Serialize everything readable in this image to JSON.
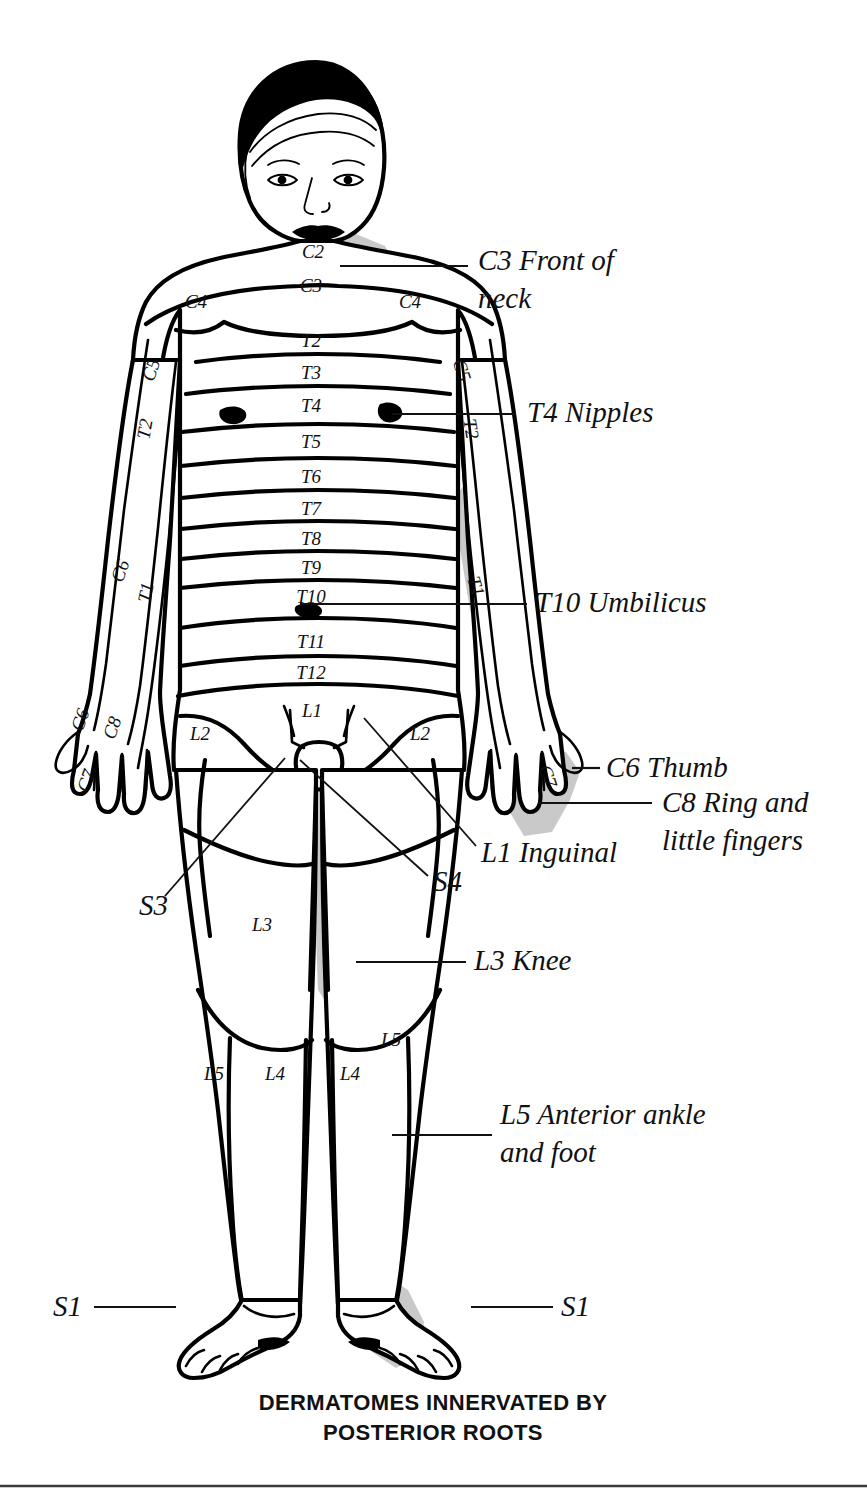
{
  "figure": {
    "caption_line1": "DERMATOMES INNERVATED BY",
    "caption_line2": "POSTERIOR ROOTS",
    "view": "anterior",
    "colors": {
      "ink": "#000000",
      "shade": "#c9c9c9",
      "background": "#ffffff"
    }
  },
  "segment_labels": [
    {
      "id": "c2-neck",
      "text": "C2",
      "x": 313,
      "y": 258,
      "rotate": 0
    },
    {
      "id": "c3-neck",
      "text": "C3",
      "x": 311,
      "y": 292,
      "rotate": 0
    },
    {
      "id": "c4-left-shoulder",
      "text": "C4",
      "x": 196,
      "y": 308,
      "rotate": 0
    },
    {
      "id": "c4-right-shoulder",
      "text": "C4",
      "x": 410,
      "y": 308,
      "rotate": 0
    },
    {
      "id": "c5-left-arm",
      "text": "C5",
      "x": 157,
      "y": 372,
      "rotate": -72
    },
    {
      "id": "c5-right-arm",
      "text": "C5",
      "x": 456,
      "y": 372,
      "rotate": 72
    },
    {
      "id": "t2-chest",
      "text": "T2",
      "x": 311,
      "y": 347,
      "rotate": 0
    },
    {
      "id": "t3-chest",
      "text": "T3",
      "x": 311,
      "y": 379,
      "rotate": 0
    },
    {
      "id": "t4-chest",
      "text": "T4",
      "x": 311,
      "y": 412,
      "rotate": 0
    },
    {
      "id": "t5-chest",
      "text": "T5",
      "x": 311,
      "y": 448,
      "rotate": 0
    },
    {
      "id": "t6-chest",
      "text": "T6",
      "x": 311,
      "y": 483,
      "rotate": 0
    },
    {
      "id": "t7-abdomen",
      "text": "T7",
      "x": 311,
      "y": 515,
      "rotate": 0
    },
    {
      "id": "t8-abdomen",
      "text": "T8",
      "x": 311,
      "y": 545,
      "rotate": 0
    },
    {
      "id": "t9-abdomen",
      "text": "T9",
      "x": 311,
      "y": 574,
      "rotate": 0
    },
    {
      "id": "t10-abdomen",
      "text": "T10",
      "x": 311,
      "y": 603,
      "rotate": 0
    },
    {
      "id": "t11-abdomen",
      "text": "T11",
      "x": 311,
      "y": 648,
      "rotate": 0
    },
    {
      "id": "t12-abdomen",
      "text": "T12",
      "x": 311,
      "y": 679,
      "rotate": 0
    },
    {
      "id": "t2-left-axilla",
      "text": "T2",
      "x": 151,
      "y": 430,
      "rotate": -80
    },
    {
      "id": "t2-right-axilla",
      "text": "T2",
      "x": 465,
      "y": 430,
      "rotate": 80
    },
    {
      "id": "c6-left-forearm",
      "text": "C6",
      "x": 126,
      "y": 573,
      "rotate": -70
    },
    {
      "id": "t1-left-forearm",
      "text": "T1",
      "x": 152,
      "y": 594,
      "rotate": -78
    },
    {
      "id": "t1-right-forearm",
      "text": "T1",
      "x": 470,
      "y": 588,
      "rotate": 73
    },
    {
      "id": "c6-left-hand",
      "text": "C6",
      "x": 86,
      "y": 722,
      "rotate": -70
    },
    {
      "id": "c8-left-hand",
      "text": "C8",
      "x": 118,
      "y": 730,
      "rotate": -70
    },
    {
      "id": "c7-left-hand",
      "text": "C7",
      "x": 92,
      "y": 783,
      "rotate": -70
    },
    {
      "id": "c7-right-hand",
      "text": "C7",
      "x": 542,
      "y": 778,
      "rotate": 72
    },
    {
      "id": "l1-groin",
      "text": "L1",
      "x": 312,
      "y": 717,
      "rotate": 0
    },
    {
      "id": "l2-left-thigh",
      "text": "L2",
      "x": 200,
      "y": 740,
      "rotate": 0
    },
    {
      "id": "l2-right-thigh",
      "text": "L2",
      "x": 420,
      "y": 740,
      "rotate": 0
    },
    {
      "id": "l3-left-thigh",
      "text": "L3",
      "x": 262,
      "y": 931,
      "rotate": 0
    },
    {
      "id": "l5-right-shin-up",
      "text": "L5",
      "x": 391,
      "y": 1046,
      "rotate": 0
    },
    {
      "id": "l5-left-shin",
      "text": "L5",
      "x": 214,
      "y": 1080,
      "rotate": 0
    },
    {
      "id": "l4-left-shin",
      "text": "L4",
      "x": 275,
      "y": 1080,
      "rotate": 0
    },
    {
      "id": "l4-right-shin",
      "text": "L4",
      "x": 350,
      "y": 1080,
      "rotate": 0
    }
  ],
  "callouts": [
    {
      "id": "c3-front-of-neck",
      "lines": [
        "C3 Front of",
        "neck"
      ],
      "text_x": 478,
      "text_y": 270,
      "line_height": 38,
      "leader": {
        "x1": 340,
        "y1": 266,
        "x2": 468,
        "y2": 266
      }
    },
    {
      "id": "t4-nipples",
      "lines": [
        "T4 Nipples"
      ],
      "text_x": 527,
      "text_y": 422,
      "line_height": 38,
      "leader": {
        "x1": 392,
        "y1": 414,
        "x2": 516,
        "y2": 414
      }
    },
    {
      "id": "t10-umbilicus",
      "lines": [
        "T10 Umbilicus"
      ],
      "text_x": 535,
      "text_y": 612,
      "line_height": 38,
      "leader": {
        "x1": 300,
        "y1": 604,
        "x2": 527,
        "y2": 604
      }
    },
    {
      "id": "c6-thumb",
      "lines": [
        "C6 Thumb"
      ],
      "text_x": 606,
      "text_y": 777,
      "line_height": 38,
      "leader": {
        "x1": 572,
        "y1": 768,
        "x2": 600,
        "y2": 768
      }
    },
    {
      "id": "c8-ring-and-little-fingers",
      "lines": [
        "C8 Ring and",
        "little fingers"
      ],
      "text_x": 662,
      "text_y": 812,
      "line_height": 38,
      "leader": {
        "x1": 538,
        "y1": 803,
        "x2": 652,
        "y2": 803
      }
    },
    {
      "id": "l1-inguinal",
      "lines": [
        "L1 Inguinal"
      ],
      "text_x": 481,
      "text_y": 862,
      "line_height": 38,
      "leader": {
        "x1": 364,
        "y1": 718,
        "x2": 476,
        "y2": 846
      }
    },
    {
      "id": "s4",
      "lines": [
        "S4"
      ],
      "text_x": 433,
      "text_y": 891,
      "line_height": 38,
      "leader": {
        "x1": 300,
        "y1": 760,
        "x2": 428,
        "y2": 876
      }
    },
    {
      "id": "s3",
      "lines": [
        "S3"
      ],
      "text_x": 139,
      "text_y": 915,
      "line_height": 38,
      "leader": {
        "x1": 285,
        "y1": 758,
        "x2": 165,
        "y2": 896
      }
    },
    {
      "id": "l3-knee",
      "lines": [
        "L3 Knee"
      ],
      "text_x": 474,
      "text_y": 970,
      "line_height": 38,
      "leader": {
        "x1": 356,
        "y1": 962,
        "x2": 466,
        "y2": 962
      }
    },
    {
      "id": "l5-anterior-ankle-and-foot",
      "lines": [
        "L5 Anterior ankle",
        "and foot"
      ],
      "text_x": 500,
      "text_y": 1124,
      "line_height": 38,
      "leader": {
        "x1": 392,
        "y1": 1135,
        "x2": 492,
        "y2": 1135
      }
    },
    {
      "id": "s1-left",
      "lines": [
        "S1"
      ],
      "text_x": 53,
      "text_y": 1316,
      "line_height": 38,
      "leader": {
        "x1": 94,
        "y1": 1307,
        "x2": 176,
        "y2": 1307
      }
    },
    {
      "id": "s1-right",
      "lines": [
        "S1"
      ],
      "text_x": 561,
      "text_y": 1316,
      "line_height": 38,
      "leader": {
        "x1": 471,
        "y1": 1307,
        "x2": 553,
        "y2": 1307
      }
    }
  ]
}
